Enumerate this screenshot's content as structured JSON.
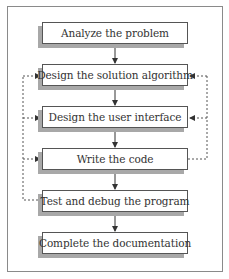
{
  "diagram": {
    "type": "flowchart",
    "steps": [
      {
        "id": "analyze",
        "label": "Analyze the problem"
      },
      {
        "id": "design-algorithm",
        "label": "Design the solution algorithm"
      },
      {
        "id": "design-ui",
        "label": "Design the user interface"
      },
      {
        "id": "write-code",
        "label": "Write the code"
      },
      {
        "id": "test-debug",
        "label": "Test and debug the program"
      },
      {
        "id": "documentation",
        "label": "Complete the documentation"
      }
    ],
    "edges": [
      {
        "from": "analyze",
        "to": "design-algorithm",
        "style": "solid"
      },
      {
        "from": "design-algorithm",
        "to": "design-ui",
        "style": "solid"
      },
      {
        "from": "design-ui",
        "to": "write-code",
        "style": "solid"
      },
      {
        "from": "write-code",
        "to": "test-debug",
        "style": "solid"
      },
      {
        "from": "test-debug",
        "to": "documentation",
        "style": "solid"
      },
      {
        "from": "write-code",
        "to": "design-algorithm",
        "style": "dashed",
        "side": "right"
      },
      {
        "from": "write-code",
        "to": "design-ui",
        "style": "dashed",
        "side": "right"
      },
      {
        "from": "test-debug",
        "to": "design-algorithm",
        "style": "dashed",
        "side": "left"
      },
      {
        "from": "test-debug",
        "to": "design-ui",
        "style": "dashed",
        "side": "left"
      },
      {
        "from": "test-debug",
        "to": "write-code",
        "style": "dashed",
        "side": "left"
      }
    ],
    "colors": {
      "border": "#555555",
      "shadow": "#a8a8a8",
      "frame": "#8a8a8a",
      "text": "#333333"
    }
  }
}
